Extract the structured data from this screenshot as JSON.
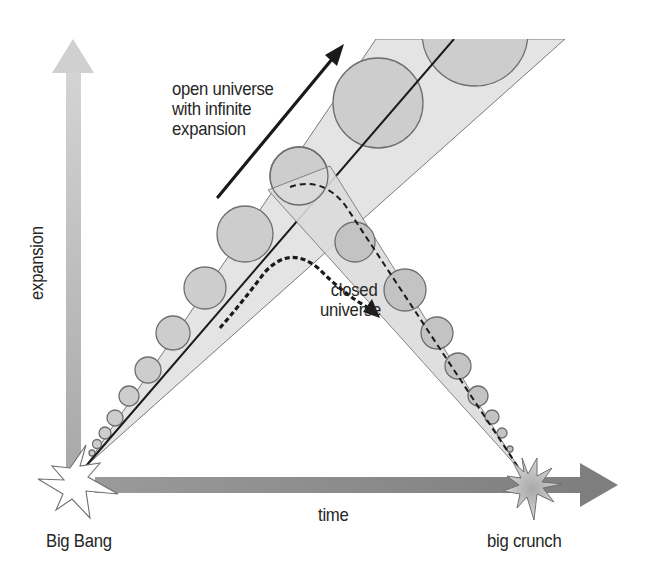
{
  "diagram": {
    "type": "universe-expansion-scenarios",
    "axes": {
      "vertical": {
        "label": "expansion",
        "icon": "arrow-up-icon",
        "color_top": "#d2d2d2",
        "color_bottom": "#a6a6a6"
      },
      "horizontal": {
        "label": "time",
        "icon": "arrow-right-icon",
        "color": "#8c8c8c"
      }
    },
    "events": {
      "start": {
        "label": "Big Bang",
        "icon": "starburst-icon",
        "fill": "#ffffff"
      },
      "end": {
        "label": "big crunch",
        "icon": "starburst-icon",
        "fill": "#bdbdbd"
      }
    },
    "scenarios": {
      "open": {
        "label_lines": [
          "open universe",
          "with infinite",
          "expansion"
        ],
        "arrow": "solid-arrow-icon",
        "description": "expanding cone with growing circles"
      },
      "closed": {
        "label_lines": [
          "closed",
          "universe"
        ],
        "arrow": "dashed-curved-arrow-icon",
        "description": "cone rises then falls back to big crunch"
      }
    },
    "colors": {
      "cone_fill": "#e3e3e3",
      "circle_fill": "#c8c8c8",
      "stroke": "#6e6e6e",
      "text": "#262626"
    }
  }
}
